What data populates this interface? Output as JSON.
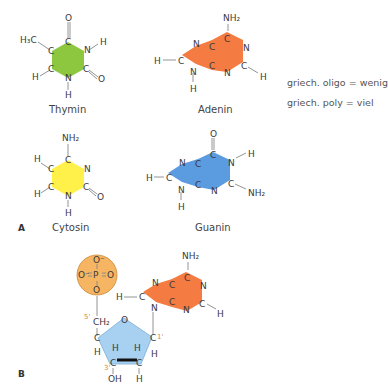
{
  "panel_a": {
    "label": "A",
    "molecules": [
      {
        "name": "Thymin",
        "color": "#8dc63f",
        "type": "pyrimidine",
        "atoms": {
          "top_o": "O",
          "methyl": "H₃C",
          "c1": "C",
          "c2": "C",
          "c3": "C",
          "c4": "C",
          "n1": "N",
          "n2": "N",
          "h_n1": "H",
          "h_c": "H",
          "h_n2": "H",
          "o2": "O"
        }
      },
      {
        "name": "Adenin",
        "color": "#f47b42",
        "type": "purine",
        "atoms": {
          "nh2": "NH₂",
          "c6": "C",
          "n1": "N",
          "c2": "C",
          "h2": "H",
          "n3": "N",
          "c4": "C",
          "c5": "C",
          "n7": "N",
          "c8": "C",
          "h8": "H",
          "n9": "N",
          "h9": "H"
        }
      },
      {
        "name": "Cytosin",
        "color": "#fff04a",
        "type": "pyrimidine",
        "atoms": {
          "nh2": "NH₂",
          "c4": "C",
          "n3": "N",
          "c2": "C",
          "o2": "O",
          "n1": "N",
          "h1": "H",
          "c6": "C",
          "h6": "H",
          "c5": "C",
          "h5": "H"
        }
      },
      {
        "name": "Guanin",
        "color": "#5b9be0",
        "type": "purine",
        "atoms": {
          "o6": "O",
          "c6": "C",
          "n1": "N",
          "h1": "H",
          "c2": "C",
          "nh2": "NH₂",
          "n3": "N",
          "c4": "C",
          "c5": "C",
          "n7": "N",
          "c8": "C",
          "h8": "H",
          "n9": "N",
          "h9": "H"
        }
      }
    ]
  },
  "notes": [
    "griech. oligo = wenig",
    "griech. poly = viel"
  ],
  "panel_b": {
    "label": "B",
    "phosphate": {
      "color": "#f5b562",
      "top": "O⁻",
      "left": "O⁻",
      "center": "P",
      "right": "O",
      "bottom": "O"
    },
    "sugar": {
      "color": "#a8d0f0",
      "ch2": "CH₂",
      "ring_o": "O",
      "c4": "C",
      "c1": "C",
      "c3": "C",
      "c2": "C",
      "h4": "H",
      "h3_up": "H",
      "h2_up": "H",
      "h1": "H",
      "oh": "OH",
      "h2_down": "H",
      "pos5": "5'",
      "pos3": "3'",
      "pos1": "1'"
    },
    "base": {
      "color": "#f47b42",
      "name": "Adenin"
    }
  }
}
